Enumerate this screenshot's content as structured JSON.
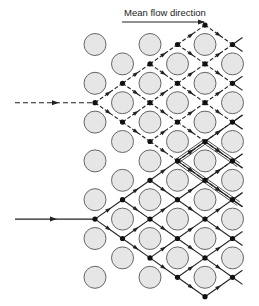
{
  "figure": {
    "title": "Mean flow direction",
    "colors": {
      "obstacle_fill": "#e6e6e6",
      "obstacle_stroke": "#666666",
      "line": "#222222",
      "node": "#111111"
    },
    "grid": {
      "columns": 6,
      "column_rows_odd": 7,
      "column_rows_even": 6
    },
    "inflows": [
      {
        "name": "dashed-inflow",
        "style": "dashed",
        "entry_row": "upper"
      },
      {
        "name": "solid-inflow",
        "style": "solid",
        "entry_row": "lower"
      }
    ],
    "highlighted_cell": {
      "style": "double-line",
      "description": "Unit cell outline between obstacles"
    }
  }
}
